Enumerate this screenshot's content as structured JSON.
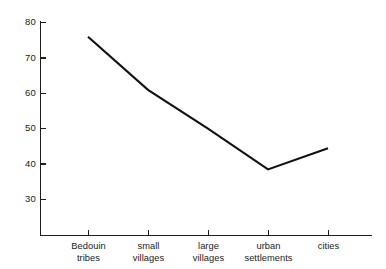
{
  "chart_data": {
    "type": "line",
    "title": "",
    "subtitle": "",
    "xlabel": "",
    "ylabel": "",
    "categories": [
      "Bedouin tribes",
      "small villages",
      "large villages",
      "urban settlements",
      "cities"
    ],
    "category_lines": [
      [
        "Bedouin",
        "tribes"
      ],
      [
        "small",
        "villages"
      ],
      [
        "large",
        "villages"
      ],
      [
        "urban",
        "settlements"
      ],
      [
        "cities"
      ]
    ],
    "values": [
      76,
      61,
      50,
      38.5,
      44.5
    ],
    "series": [
      {
        "name": "",
        "values": [
          76,
          61,
          50,
          38.5,
          44.5
        ]
      }
    ],
    "ylim": [
      22,
      82
    ],
    "yticks": [
      30,
      40,
      50,
      60,
      70,
      80
    ],
    "ytick_labels": [
      "30",
      "40",
      "50",
      "60",
      "70",
      "80"
    ],
    "xtick_labels": [
      "Bedouin tribes",
      "small villages",
      "large villages",
      "urban settlements",
      "cities"
    ],
    "grid": false,
    "legend": false,
    "legend_position": "none",
    "markers": false,
    "line_color": "#111111",
    "axis_color": "#1d1d1d",
    "background_color": "#ffffff",
    "annotations": []
  }
}
